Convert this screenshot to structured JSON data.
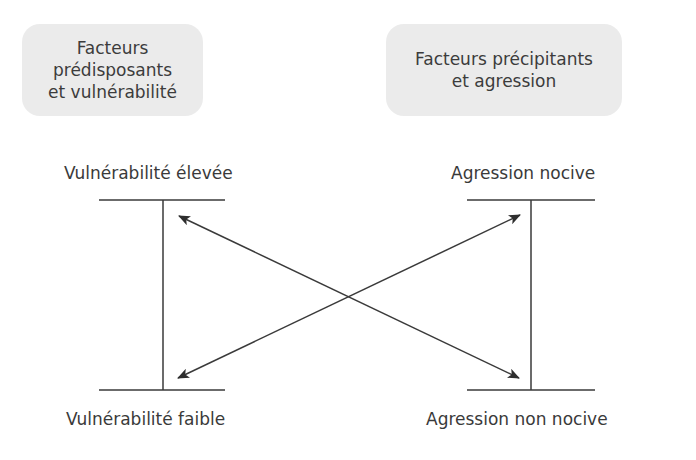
{
  "headers": {
    "left": {
      "line1": "Facteurs prédisposants",
      "line2": "et vulnérabilité"
    },
    "right": {
      "line1": "Facteurs précipitants",
      "line2": "et agression"
    }
  },
  "scales": {
    "left": {
      "top_label": "Vulnérabilité élevée",
      "bottom_label": "Vulnérabilité faible"
    },
    "right": {
      "top_label": "Agression nocive",
      "bottom_label": "Agression non nocive"
    }
  },
  "arrows": [
    {
      "from": "Vulnérabilité élevée",
      "to": "Agression non nocive",
      "bidirectional": true
    },
    {
      "from": "Vulnérabilité faible",
      "to": "Agression nocive",
      "bidirectional": true
    }
  ],
  "colors": {
    "box_fill": "#ebebeb",
    "line": "#3a3a3a",
    "text": "#3a3a3a"
  }
}
